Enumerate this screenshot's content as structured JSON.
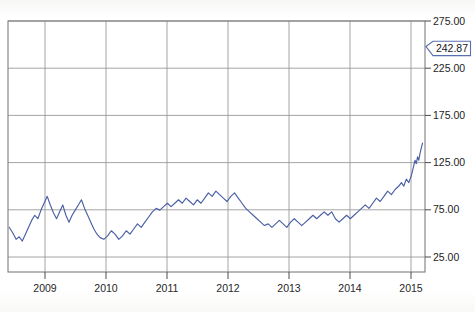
{
  "chart_data": {
    "type": "line",
    "title": "",
    "subtitle": "",
    "xlabel": "",
    "ylabel": "",
    "grid": true,
    "legend": null,
    "legend_position": "none",
    "xlim": [
      2008.5,
      2015.2
    ],
    "ylim": [
      0,
      292
    ],
    "yticks": [
      25,
      75,
      125,
      175,
      225,
      275
    ],
    "ytick_labels": [
      "25.00",
      "75.00",
      "125.00",
      "175.00",
      "225.00",
      "275.00"
    ],
    "xticks": [
      2009,
      2010,
      2011,
      2012,
      2013,
      2014,
      2015
    ],
    "xtick_labels": [
      "2009",
      "2010",
      "2011",
      "2012",
      "2013",
      "2014",
      "2015"
    ],
    "line_color": "#4a5fa5",
    "grid_color": "#9a9a9a",
    "axis_color": "#7d7d7d",
    "series": [
      {
        "name": "price",
        "x": [
          2008.52,
          2008.58,
          2008.63,
          2008.68,
          2008.73,
          2008.78,
          2008.83,
          2008.88,
          2008.93,
          2008.98,
          2009.03,
          2009.08,
          2009.13,
          2009.18,
          2009.23,
          2009.28,
          2009.33,
          2009.38,
          2009.43,
          2009.48,
          2009.53,
          2009.58,
          2009.63,
          2009.68,
          2009.73,
          2009.78,
          2009.83,
          2009.88,
          2009.93,
          2009.98,
          2010.04,
          2010.1,
          2010.16,
          2010.22,
          2010.28,
          2010.34,
          2010.4,
          2010.46,
          2010.52,
          2010.58,
          2010.64,
          2010.7,
          2010.76,
          2010.82,
          2010.88,
          2010.94,
          2011.0,
          2011.06,
          2011.12,
          2011.18,
          2011.24,
          2011.3,
          2011.36,
          2011.42,
          2011.48,
          2011.54,
          2011.6,
          2011.66,
          2011.72,
          2011.78,
          2011.84,
          2011.9,
          2011.96,
          2012.02,
          2012.08,
          2012.14,
          2012.2,
          2012.26,
          2012.32,
          2012.38,
          2012.44,
          2012.5,
          2012.56,
          2012.62,
          2012.68,
          2012.74,
          2012.8,
          2012.86,
          2012.92,
          2012.98,
          2013.04,
          2013.1,
          2013.16,
          2013.22,
          2013.28,
          2013.34,
          2013.4,
          2013.46,
          2013.52,
          2013.58,
          2013.64,
          2013.7,
          2013.76,
          2013.82,
          2013.88,
          2013.94,
          2014.0,
          2014.06,
          2014.12,
          2014.18,
          2014.24,
          2014.3,
          2014.36,
          2014.42,
          2014.48,
          2014.54,
          2014.6,
          2014.66,
          2014.72,
          2014.78,
          2014.82,
          2014.86,
          2014.9,
          2014.94,
          2014.98,
          2015.0,
          2015.02,
          2015.04,
          2015.06,
          2015.08,
          2015.1,
          2015.12,
          2015.14,
          2015.16
        ],
        "y": [
          52,
          45,
          38,
          41,
          36,
          44,
          52,
          60,
          66,
          62,
          72,
          80,
          88,
          78,
          69,
          62,
          70,
          78,
          66,
          58,
          66,
          72,
          78,
          84,
          74,
          66,
          58,
          50,
          44,
          40,
          38,
          42,
          48,
          44,
          38,
          42,
          48,
          44,
          50,
          56,
          52,
          58,
          64,
          70,
          74,
          72,
          76,
          80,
          76,
          80,
          84,
          80,
          86,
          82,
          78,
          84,
          80,
          86,
          92,
          88,
          94,
          90,
          86,
          82,
          88,
          92,
          86,
          80,
          74,
          70,
          66,
          62,
          58,
          54,
          56,
          52,
          56,
          60,
          56,
          52,
          58,
          62,
          58,
          54,
          58,
          62,
          66,
          62,
          66,
          70,
          66,
          70,
          62,
          58,
          62,
          66,
          62,
          66,
          70,
          74,
          78,
          74,
          80,
          86,
          82,
          88,
          94,
          90,
          96,
          100,
          104,
          100,
          108,
          104,
          112,
          118,
          124,
          130,
          126,
          134,
          130,
          138,
          144,
          150
        ]
      }
    ],
    "callout": {
      "value": "242.87",
      "value_numeric": 242.87
    }
  }
}
